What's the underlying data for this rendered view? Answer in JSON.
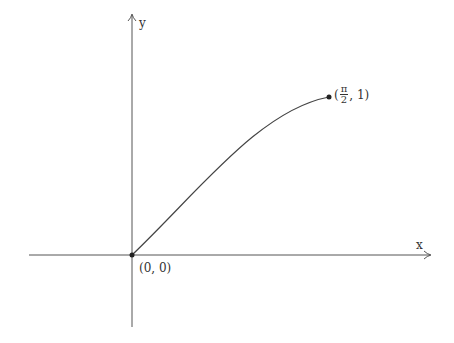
{
  "diagram": {
    "type": "function-plot",
    "axes": {
      "x_label": "x",
      "y_label": "y"
    },
    "curve": "y = sin(x), 0 ≤ x ≤ π/2",
    "points": [
      {
        "name": "origin",
        "label": "(0, 0)"
      },
      {
        "name": "end",
        "label_open": "(",
        "label_num": "π",
        "label_den": "2",
        "label_close": ", 1)"
      }
    ],
    "colors": {
      "stroke": "#333333",
      "background": "#ffffff"
    }
  }
}
